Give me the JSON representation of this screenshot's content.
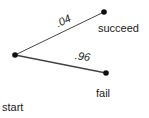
{
  "diagram": {
    "type": "probability-tree",
    "colors": {
      "line": "#444444",
      "node": "#111111",
      "text": "#222222"
    },
    "nodes": {
      "start": {
        "label": "start",
        "x": 15,
        "y": 55
      },
      "succeed": {
        "label": "succeed",
        "x": 104,
        "y": 12
      },
      "fail": {
        "label": "fail",
        "x": 106,
        "y": 73
      }
    },
    "edges": [
      {
        "from": "start",
        "to": "succeed",
        "probability": ".04"
      },
      {
        "from": "start",
        "to": "fail",
        "probability": ".96"
      }
    ]
  }
}
